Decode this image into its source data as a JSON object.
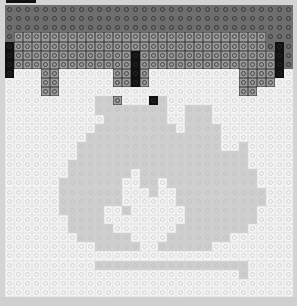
{
  "image": {
    "description": "Grayscale brick-mosaic of a flame icon under a dark top band",
    "grid": {
      "columns": 32,
      "rows": 32,
      "stud_pitch_px": 9
    },
    "palette": {
      "D": "#6e6e6e",
      "M": "#9a9a9a",
      "K": "#111111",
      "G": "#cfcfcf",
      "W": "#f4f4f4"
    },
    "rows": [
      "DDDDDDDDDDDDDDDDDDDDDDDDDDDDDDDD",
      "DDDDDDDDDDDDDDDDDDDDDDDDDDDDDDDD",
      "DDDDDDDDDDDDDDDDDDDDDDDDDDDDDDDD",
      "DMMMMMMMMMMMMMMMMMMMMMMMMMMMMDDD",
      "KMMMMMMMMMMMMMMMMMMMMMMMMMMMMDKD",
      "KMMMMMMMMMMMMMKMMMMMMMMMMMMMMMKD",
      "KMMMMMMMMMMMMMKMMMMMMMMMMMMMMMKD",
      "KWWWMMWWWWWWMMKMWWWWWWWWWWMMMMKW",
      "WWWWMMWWWWWWMMKMWWWWWWWWWWMMMMWW",
      "WWWWMMWWWWWWWWWWWWWWWWWWWWMMWWWW",
      "WWWWWWWWWWGGMWWWKGWWWWWWWWWWWWWW",
      "WWWWWWWWWWGGGGGGGGWWGGGWWWWWWWWW",
      "WWWWWWWWWWWGGGGGGGWWGGGWWWWWWWWW",
      "WWWWWWWWWWGGGGGGGGGWGGGGWWWWWWWW",
      "WWWWWWWWWGGGGGGGGGGGGGGGWWWWWWWW",
      "WWWWWWWWGGGGGGGGGGGGGGGGWWGWWWWW",
      "WWWWWWWWGGGGGGGGGGGGGGGGGGGWWWWW",
      "WWWWWWWGGGGGGGGGGGGGGGGGGGGWWWWW",
      "WWWWWWWGGGGGGGWGGGGGGGGGGGGGWWWW",
      "WWWWWWGGGGGGGWWGGWGGGGGGGGGGWWWW",
      "WWWWWWGGGGGGGWWWGWWGGGGGGGGGGWWW",
      "WWWWWWGGGGGGGWWWWWWGGGGGGGGGGWWW",
      "WWWWWWGGGGGWWGWWWWWWGGGGGGGGWWWW",
      "WWWWWWWGGGGWWWWWWWWWGGGGGGGGWWWW",
      "WWWWWWWGGGGGWWWWWWWGGGGGGGGWWWWW",
      "WWWWWWWWGGGGGGWWWWGGGGGGGWWWWWWW",
      "WWWWWWWWWWGGGGGWWGGGGGGWWWWWWWWW",
      "WWWWWWWWWWWWWWWWWWWWWWWWWWWWWWWW",
      "WWWWWWWWWWGGGGGGGGGGGGGGGGGWWWWW",
      "WWWWWWWWWWWWWWWWWWWWWWWWWWGWWWWW",
      "WWWWWWWWWWWWWWWWWWWWWWWWWWWWWWWW",
      "WWWWWWWWWWWWWWWWWWWWWWWWWWWWWWWW"
    ]
  }
}
